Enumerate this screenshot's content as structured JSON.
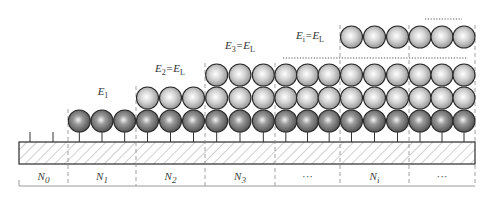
{
  "diagram": {
    "colors": {
      "dark_sphere": "#6e6e6e",
      "light_sphere": "#c8c8c8",
      "outline": "#2a2a2a",
      "hatch": "#7a7a7a",
      "divider": "#888888"
    },
    "energy_labels": [
      {
        "id": "E1",
        "base": "E",
        "sub": "1",
        "rest": "",
        "x": 103,
        "y": 97
      },
      {
        "id": "E2",
        "base": "E",
        "sub": "2",
        "rest": "=E",
        "rest_sub": "L",
        "x": 170,
        "y": 74
      },
      {
        "id": "E3",
        "base": "E",
        "sub": "3",
        "rest": "=E",
        "rest_sub": "L",
        "x": 240,
        "y": 51
      },
      {
        "id": "Ei",
        "base": "E",
        "sub": "i",
        "rest": "=E",
        "rest_sub": "L",
        "x": 310,
        "y": 41
      }
    ],
    "segments": [
      {
        "label": "N",
        "sub": "0",
        "x0": 19,
        "x1": 68,
        "layers": 0
      },
      {
        "label": "N",
        "sub": "1",
        "x0": 68,
        "x1": 136,
        "layers": 1
      },
      {
        "label": "N",
        "sub": "2",
        "x0": 136,
        "x1": 205,
        "layers": 2
      },
      {
        "label": "N",
        "sub": "3",
        "x0": 205,
        "x1": 275,
        "layers": 3
      },
      {
        "label": "···",
        "sub": "",
        "x0": 275,
        "x1": 340,
        "layers": 3
      },
      {
        "label": "N",
        "sub": "i",
        "x0": 340,
        "x1": 409,
        "layers": 4
      },
      {
        "label": "···",
        "sub": "",
        "x0": 409,
        "x1": 475,
        "layers": 4
      }
    ],
    "ellipsis_markers": [
      "······",
      "············"
    ]
  }
}
